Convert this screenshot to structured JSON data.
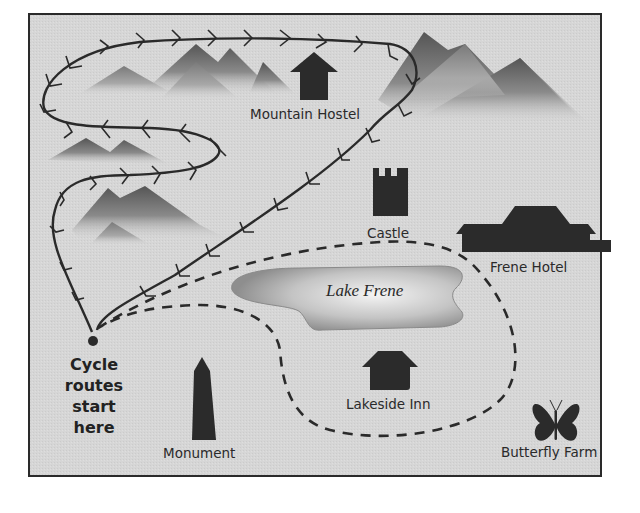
{
  "map": {
    "background_color": "#d5d5d5",
    "border_color": "#2a2a2a",
    "start_point": {
      "label_lines": [
        "Cycle",
        "routes",
        "start",
        "here"
      ]
    },
    "lake": {
      "label": "Lake Frene"
    },
    "landmarks": [
      {
        "id": "mountain-hostel",
        "label": "Mountain Hostel",
        "icon": "pagoda-icon"
      },
      {
        "id": "castle",
        "label": "Castle",
        "icon": "castle-tower-icon"
      },
      {
        "id": "frene-hotel",
        "label": "Frene Hotel",
        "icon": "hotel-building-icon"
      },
      {
        "id": "lakeside-inn",
        "label": "Lakeside Inn",
        "icon": "house-icon"
      },
      {
        "id": "monument",
        "label": "Monument",
        "icon": "obelisk-icon"
      },
      {
        "id": "butterfly-farm",
        "label": "Butterfly Farm",
        "icon": "butterfly-icon"
      }
    ],
    "routes": [
      {
        "id": "mountain-route",
        "style": "solid-with-arrows"
      },
      {
        "id": "lake-route",
        "style": "dashed"
      }
    ]
  }
}
